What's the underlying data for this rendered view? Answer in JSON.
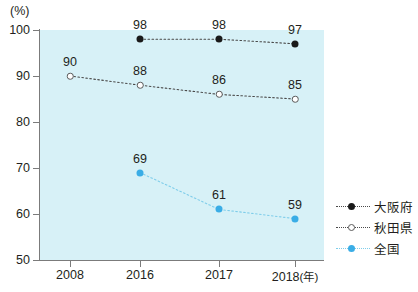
{
  "chart_data": {
    "type": "line",
    "title": "",
    "xlabel": "年",
    "ylabel": "(%)",
    "unit_label": "(%)",
    "x_unit_label": "(年)",
    "categories": [
      "2008",
      "2016",
      "2017",
      "2018"
    ],
    "ylim": [
      50,
      100
    ],
    "yticks": [
      50,
      60,
      70,
      80,
      90,
      100
    ],
    "ytick_labels": [
      "50",
      "60",
      "70",
      "80",
      "90",
      "100"
    ],
    "grid": false,
    "legend_position": "right",
    "plot_background": "#d7f1f7",
    "series": [
      {
        "name": "大阪府",
        "color": "#1a1a1a",
        "marker": "filled-circle",
        "line_style": "dotted",
        "x": [
          "2016",
          "2017",
          "2018"
        ],
        "values": [
          98,
          98,
          97
        ],
        "labels": [
          "98",
          "98",
          "97"
        ]
      },
      {
        "name": "秋田県",
        "color": "#5a5a5a",
        "marker": "hollow-circle",
        "line_style": "dotted",
        "x": [
          "2008",
          "2016",
          "2017",
          "2018"
        ],
        "values": [
          90,
          88,
          86,
          85
        ],
        "labels": [
          "90",
          "88",
          "86",
          "85"
        ]
      },
      {
        "name": "全国",
        "color": "#3aade6",
        "marker": "filled-circle",
        "line_style": "dotted",
        "x": [
          "2016",
          "2017",
          "2018"
        ],
        "values": [
          69,
          61,
          59
        ],
        "labels": [
          "69",
          "61",
          "59"
        ]
      }
    ]
  },
  "legend": {
    "items": [
      {
        "label": "大阪府",
        "marker": "filled-circle-black"
      },
      {
        "label": "秋田県",
        "marker": "hollow-circle"
      },
      {
        "label": "全国",
        "marker": "filled-circle-blue"
      }
    ]
  },
  "axis": {
    "y_unit": "(%)",
    "x_unit": "(年)",
    "ytick_labels": [
      "100",
      "90",
      "80",
      "70",
      "60",
      "50"
    ],
    "xtick_labels": [
      "2008",
      "2016",
      "2017",
      "2018"
    ]
  }
}
